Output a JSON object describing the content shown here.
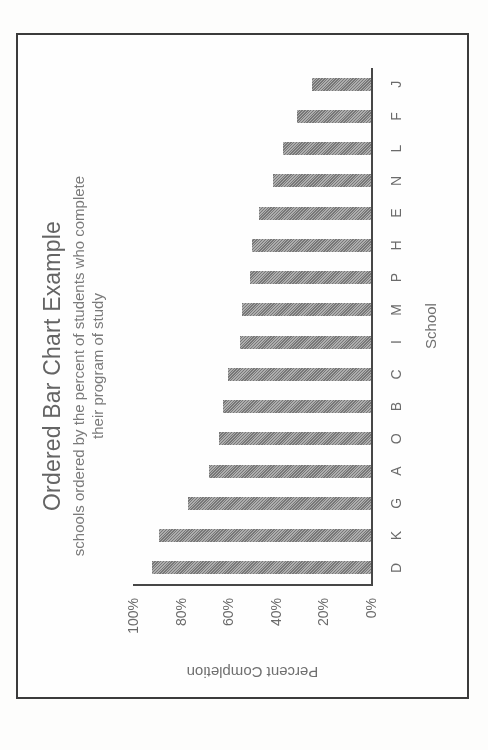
{
  "figure": {
    "frame_border_color": "#3b3b3b",
    "page_background": "#fdfdfc"
  },
  "chart_data": {
    "type": "bar",
    "title": "Ordered Bar Chart Example",
    "subtitle": "schools ordered by the percent of students who complete their program of study",
    "subtitle_lines": [
      "schools ordered by the percent of students who complete",
      "their program of study"
    ],
    "categories": [
      "D",
      "K",
      "G",
      "A",
      "O",
      "B",
      "C",
      "I",
      "M",
      "P",
      "H",
      "E",
      "N",
      "L",
      "F",
      "J"
    ],
    "values": [
      92,
      89,
      77,
      68,
      64,
      62,
      60,
      55,
      54,
      51,
      50,
      47,
      41,
      37,
      31,
      25
    ],
    "xlabel": "School",
    "ylabel": "Percent Completion",
    "ylim": [
      0,
      100
    ],
    "ytick_values": [
      0,
      20,
      40,
      60,
      80,
      100
    ],
    "ytick_labels": [
      "0%",
      "20%",
      "40%",
      "60%",
      "80%",
      "100%"
    ],
    "grid": "off",
    "legend": "none",
    "bar_color": "#8e8e8e",
    "axis_color": "#474747",
    "text_color": "#6b6b6b",
    "page_rotation_deg": -90
  }
}
